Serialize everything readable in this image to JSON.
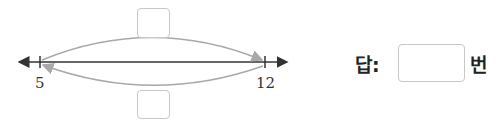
{
  "number_line": {
    "start_label": "5",
    "end_label": "12"
  },
  "answer": {
    "prefix": "답:",
    "suffix": "번",
    "value": ""
  },
  "colors": {
    "axis": "#333333",
    "arc": "#a8a8a8",
    "box_border": "#c8c8c8"
  }
}
